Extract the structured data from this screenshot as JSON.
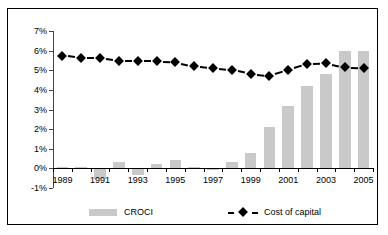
{
  "chart_data": {
    "type": "bar",
    "title": "",
    "xlabel": "",
    "ylabel": "",
    "ylim": [
      -1,
      7
    ],
    "yticks": [
      -1,
      0,
      1,
      2,
      3,
      4,
      5,
      6,
      7
    ],
    "ytick_labels": [
      "-1%",
      "0%",
      "1%",
      "2%",
      "3%",
      "4%",
      "5%",
      "6%",
      "7%"
    ],
    "grid": false,
    "legend_position": "bottom",
    "categories": [
      1989,
      1990,
      1991,
      1992,
      1993,
      1994,
      1995,
      1996,
      1997,
      1998,
      1999,
      2000,
      2001,
      2002,
      2003,
      2004,
      2005
    ],
    "xtick_labels": [
      "1989",
      "1991",
      "1993",
      "1995",
      "1997",
      "1999",
      "2001",
      "2003",
      "2005"
    ],
    "xtick_values": [
      1989,
      1991,
      1993,
      1995,
      1997,
      1999,
      2001,
      2003,
      2005
    ],
    "series": [
      {
        "name": "CROCI",
        "type": "bar",
        "color": "#c9c9c9",
        "values": [
          0.05,
          0.05,
          -0.55,
          0.35,
          -0.35,
          0.2,
          0.45,
          0.05,
          -0.1,
          0.3,
          0.8,
          2.1,
          3.2,
          4.2,
          4.8,
          6.0,
          6.0
        ]
      },
      {
        "name": "Cost of capital",
        "type": "line",
        "color": "#000000",
        "marker": "diamond",
        "linestyle": "dashed",
        "values": [
          5.75,
          5.6,
          5.6,
          5.45,
          5.45,
          5.45,
          5.4,
          5.2,
          5.1,
          5.0,
          4.8,
          4.7,
          5.0,
          5.3,
          5.35,
          5.15,
          5.1
        ]
      }
    ]
  },
  "legend": {
    "entries": [
      {
        "label": "CROCI",
        "style": "bar",
        "color": "#c9c9c9"
      },
      {
        "label": "Cost of capital",
        "style": "dashed-diamond",
        "color": "#000000"
      }
    ]
  }
}
